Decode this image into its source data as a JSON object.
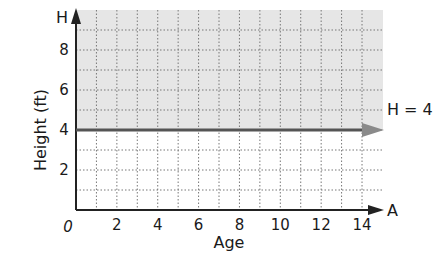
{
  "chart_data": {
    "type": "line",
    "title": "",
    "xlabel": "Age",
    "ylabel": "Height (ft)",
    "x_axis_letter": "A",
    "y_axis_letter": "H",
    "xlim": [
      0,
      14
    ],
    "ylim": [
      0,
      9.5
    ],
    "x_ticks": [
      0,
      2,
      4,
      6,
      8,
      10,
      12,
      14
    ],
    "y_ticks": [
      2,
      4,
      6,
      8
    ],
    "origin_label": "0",
    "grid": true,
    "grid_style": "dotted",
    "x_grid_step": 1,
    "y_grid_step": 1,
    "series": [
      {
        "name": "H = 4",
        "label": "H = 4",
        "type": "horizontal_ray",
        "x": [
          0,
          14.5
        ],
        "y": [
          4,
          4
        ],
        "arrow_end": true
      }
    ],
    "shaded_region": {
      "description": "H > 4",
      "y_from": 4,
      "y_to": 9.5,
      "color": "#e6e6e6"
    },
    "colors": {
      "line": "#555555",
      "arrowhead": "#8a8a8a",
      "grid": "#777777",
      "axis": "#222222",
      "shade": "#e6e6e6"
    }
  }
}
